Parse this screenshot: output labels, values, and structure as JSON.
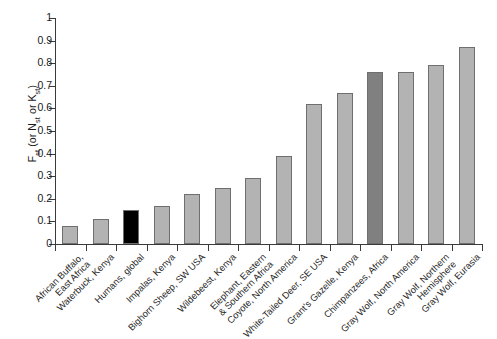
{
  "chart_data": {
    "type": "bar",
    "title": "",
    "subtitle": "",
    "xlabel": "",
    "ylabel": "Fst (or Nst or Kst)",
    "ylabel_parts": {
      "base1": "F",
      "sub1": "st",
      "mid": " (or N",
      "sub2": "st",
      "mid2": " or K",
      "sub3": "st",
      "tail": ")"
    },
    "ylim": [
      0,
      1
    ],
    "ytick_step": 0.1,
    "yticks": [
      "0",
      "0.1",
      "0.2",
      "0.3",
      "0.4",
      "0.5",
      "0.6",
      "0.7",
      "0.8",
      "0.9",
      "1"
    ],
    "grid": false,
    "legend": false,
    "legend_position": "none",
    "categories": [
      "African Buffalo,\nEast Africa",
      "Waterbuck, Kenya",
      "Humans, global",
      "Impalas, Kenya",
      "Bighorn Sheep, SW USA",
      "Wildebeest, Kenya",
      "Elephant, Eastern\n& Southern Africa",
      "Coyote, North America",
      "White-Tailed Deer, SE USA",
      "Grant's Gazelle, Kenya",
      "Chimpanzees, Africa",
      "Gray Wolf, North America",
      "Gray Wolf, Northern\nHemisphere",
      "Gray Wolf, Eurasia"
    ],
    "values": [
      0.08,
      0.11,
      0.15,
      0.17,
      0.22,
      0.25,
      0.29,
      0.39,
      0.62,
      0.67,
      0.76,
      0.76,
      0.79,
      0.87
    ],
    "bar_colors": [
      "#b3b3b3",
      "#b3b3b3",
      "#000000",
      "#b3b3b3",
      "#b3b3b3",
      "#b3b3b3",
      "#b3b3b3",
      "#b3b3b3",
      "#b3b3b3",
      "#b3b3b3",
      "#808080",
      "#b3b3b3",
      "#b3b3b3",
      "#b3b3b3"
    ],
    "bar_edge_color": "#6f6f6f",
    "highlight_colors": {
      "default_bar": "#b3b3b3",
      "humans_bar": "#000000",
      "chimpanzees_bar": "#808080"
    },
    "axis_color": "#3a3a3a",
    "background": "#ffffff"
  }
}
